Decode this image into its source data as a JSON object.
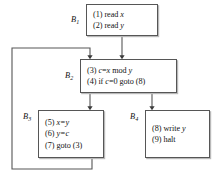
{
  "diagram": {
    "type": "control-flow-graph",
    "line_color": "#565656",
    "text_color": "#141414",
    "background": "#ffffff",
    "blocks": [
      {
        "id": "B1",
        "label": "B",
        "subscript": "1",
        "statements": [
          {
            "num": "(1)",
            "text": "read ",
            "var": "x"
          },
          {
            "num": "(2)",
            "text": "read ",
            "var": "y"
          }
        ]
      },
      {
        "id": "B2",
        "label": "B",
        "subscript": "2",
        "statements": [
          {
            "num": "(3)",
            "text": "c=x mod y"
          },
          {
            "num": "(4)",
            "text": "if c=0 goto (8)"
          }
        ]
      },
      {
        "id": "B3",
        "label": "B",
        "subscript": "3",
        "statements": [
          {
            "num": "(5)",
            "text": "x=y"
          },
          {
            "num": "(6)",
            "text": "y=c"
          },
          {
            "num": "(7)",
            "text": "goto (3)"
          }
        ]
      },
      {
        "id": "B4",
        "label": "B",
        "subscript": "4",
        "statements": [
          {
            "num": "(8)",
            "text": "write ",
            "var": "y"
          },
          {
            "num": "(9)",
            "text": "halt"
          }
        ]
      }
    ],
    "edges": [
      {
        "from": "B1",
        "to": "B2",
        "kind": "straight-down"
      },
      {
        "from": "B2",
        "to": "B3",
        "kind": "straight-down"
      },
      {
        "from": "B2",
        "to": "B4",
        "kind": "straight-down"
      },
      {
        "from": "B3",
        "to": "B2",
        "kind": "back-edge-left-loop"
      }
    ]
  },
  "text": {
    "b1_s1": "(1) read",
    "b1_s1_var": "x",
    "b1_s2": "(2) read",
    "b1_s2_var": "y",
    "b2_s1_num": "(3)",
    "b2_s1_a": "c",
    "b2_s1_b": "=",
    "b2_s1_c": "x",
    "b2_s1_d": "mod",
    "b2_s1_e": "y",
    "b2_s2_num": "(4) if",
    "b2_s2_a": "c",
    "b2_s2_b": "=0 goto (8)",
    "b3_s1_num": "(5)",
    "b3_s1_a": "x=y",
    "b3_s2_num": "(6)",
    "b3_s2_a": "y=c",
    "b3_s3": "(7) goto (3)",
    "b4_s1": "(8) write",
    "b4_s1_var": "y",
    "b4_s2": "(9) halt",
    "b1_label": "B",
    "b1_sub": "1",
    "b2_label": "B",
    "b2_sub": "2",
    "b3_label": "B",
    "b3_sub": "3",
    "b4_label": "B",
    "b4_sub": "4"
  }
}
